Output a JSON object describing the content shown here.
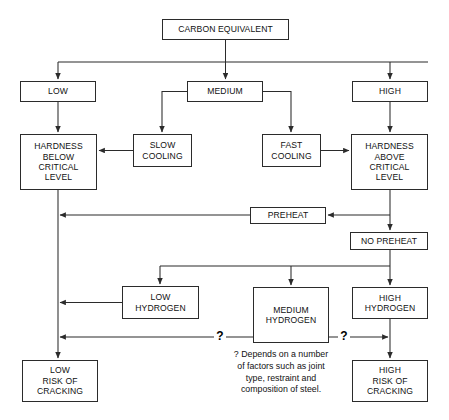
{
  "diagram": {
    "title_node": "CARBON EQUIVALENT",
    "nodes": [
      {
        "id": "carbon-equivalent",
        "label": "CARBON EQUIVALENT",
        "x": 162,
        "y": 19,
        "w": 127,
        "h": 21
      },
      {
        "id": "low",
        "label": "LOW",
        "x": 20,
        "y": 81,
        "w": 76,
        "h": 21
      },
      {
        "id": "medium",
        "label": "MEDIUM",
        "x": 187,
        "y": 81,
        "w": 76,
        "h": 21
      },
      {
        "id": "high",
        "label": "HIGH",
        "x": 352,
        "y": 81,
        "w": 76,
        "h": 21
      },
      {
        "id": "hardness-below",
        "label": "HARDNESS\nBELOW\nCRITICAL\nLEVEL",
        "x": 20,
        "y": 134,
        "w": 77,
        "h": 56
      },
      {
        "id": "slow-cooling",
        "label": "SLOW\nCOOLING",
        "x": 133,
        "y": 134,
        "w": 59,
        "h": 33
      },
      {
        "id": "fast-cooling",
        "label": "FAST\nCOOLING",
        "x": 262,
        "y": 134,
        "w": 59,
        "h": 33
      },
      {
        "id": "hardness-above",
        "label": "HARDNESS\nABOVE\nCRITICAL\nLEVEL",
        "x": 351,
        "y": 134,
        "w": 77,
        "h": 56
      },
      {
        "id": "preheat",
        "label": "PREHEAT",
        "x": 250,
        "y": 207,
        "w": 76,
        "h": 17
      },
      {
        "id": "no-preheat",
        "label": "NO PREHEAT",
        "x": 350,
        "y": 232,
        "w": 78,
        "h": 18
      },
      {
        "id": "low-hydrogen",
        "label": "LOW\nHYDROGEN",
        "x": 122,
        "y": 286,
        "w": 77,
        "h": 33
      },
      {
        "id": "medium-hydrogen",
        "label": "MEDIUM\nHYDROGEN",
        "x": 253,
        "y": 287,
        "w": 76,
        "h": 56
      },
      {
        "id": "high-hydrogen",
        "label": "HIGH\nHYDROGEN",
        "x": 352,
        "y": 287,
        "w": 76,
        "h": 32
      },
      {
        "id": "low-risk",
        "label": "LOW\nRISK OF\nCRACKING",
        "x": 22,
        "y": 360,
        "w": 76,
        "h": 42
      },
      {
        "id": "high-risk",
        "label": "HIGH\nRISK OF\nCRACKING",
        "x": 352,
        "y": 360,
        "w": 76,
        "h": 42
      }
    ],
    "question_marks": [
      {
        "id": "question-mark-left",
        "label": "?",
        "x": 214,
        "y": 330
      },
      {
        "id": "question-mark-right",
        "label": "?",
        "x": 338,
        "y": 330
      }
    ],
    "caption": {
      "text": "? Depends on a number\nof factors such as joint\ntype, restraint and\ncomposition of steel.",
      "x": 222,
      "y": 349,
      "w": 118
    },
    "colors": {
      "line": "#2b2b2b",
      "box_border": "#2b2b2b",
      "text": "#111111",
      "background": "#ffffff"
    }
  }
}
